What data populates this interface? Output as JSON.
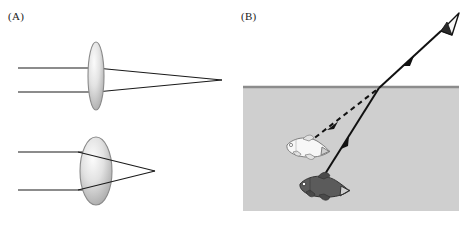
{
  "figure": {
    "width": 469,
    "height": 226,
    "background": "#ffffff",
    "type": "scientific-illustration"
  },
  "panels": [
    {
      "id": "A",
      "label": "(A)",
      "title": "Lens refraction and focal length",
      "diagrams": [
        {
          "id": "thin-lens",
          "lens_type": "thin converging lens",
          "lens_cx": 96,
          "lens_cy": 76,
          "lens_rx": 8,
          "lens_ry": 34,
          "focal_point_x": 222,
          "focal_point_y": 80,
          "focal_length_px": 126,
          "focal_description": "long focal length",
          "rays": [
            {
              "name": "upper-ray",
              "y_in": 68,
              "x_start": 18,
              "x_end": 222
            },
            {
              "name": "lower-ray",
              "y_in": 92,
              "x_start": 18,
              "x_end": 222
            }
          ]
        },
        {
          "id": "thick-lens",
          "lens_type": "thick converging lens",
          "lens_cx": 96,
          "lens_cy": 171,
          "lens_rx": 16,
          "lens_ry": 34,
          "focal_point_x": 155,
          "focal_point_y": 171,
          "focal_length_px": 59,
          "focal_description": "short focal length",
          "rays": [
            {
              "name": "upper-ray",
              "y_in": 152,
              "x_start": 18,
              "x_end": 155
            },
            {
              "name": "lower-ray",
              "y_in": 190,
              "x_start": 18,
              "x_end": 155
            }
          ]
        }
      ]
    },
    {
      "id": "B",
      "label": "(B)",
      "title": "Apparent depth of a fish seen through water",
      "water": {
        "x": 243,
        "y": 86,
        "width": 216,
        "height": 125,
        "fill": "#cfcfcf",
        "surface_line_color": "#8c8c8c",
        "surface_y": 86
      },
      "refraction_point": {
        "x": 379,
        "y": 88
      },
      "eye": {
        "x": 446,
        "y": 22,
        "label": "observer eye",
        "fill": "#f2f2f2",
        "outline": "#1a1a1a"
      },
      "real_ray": {
        "name": "real-light-ray",
        "style": "solid",
        "color": "#111111",
        "from": {
          "x": 320,
          "y": 182
        },
        "bend": {
          "x": 379,
          "y": 88
        },
        "to": {
          "x": 441,
          "y": 31
        },
        "arrow_positions": [
          {
            "x": 347,
            "y": 139
          },
          {
            "x": 409,
            "y": 60
          }
        ]
      },
      "virtual_ray": {
        "name": "apparent-light-ray",
        "style": "dashed",
        "color": "#111111",
        "from": {
          "x": 308,
          "y": 143
        },
        "to": {
          "x": 379,
          "y": 88
        },
        "arrow_positions": [
          {
            "x": 332,
            "y": 124
          }
        ]
      },
      "fish": [
        {
          "name": "apparent-fish",
          "description": "virtual image of the fish, appears nearer the surface",
          "x": 287,
          "y": 145,
          "length": 46,
          "body_fill": "#f5f5f5",
          "outline": "#7d7d7d",
          "shade": "light"
        },
        {
          "name": "real-fish",
          "description": "actual fish, deeper in the water",
          "x": 300,
          "y": 184,
          "length": 52,
          "body_fill": "#595959",
          "outline": "#333333",
          "shade": "dark"
        }
      ]
    }
  ],
  "colors": {
    "lens_outline": "#8a8a8a",
    "lens_fill_light": "#f0f0f0",
    "lens_fill_mid": "#d6d6d6",
    "lens_fill_dark": "#a8a8a8",
    "ray_line": "#1a1a1a",
    "water_fill": "#cfcfcf",
    "water_surface": "#8c8c8c",
    "background": "#ffffff"
  }
}
